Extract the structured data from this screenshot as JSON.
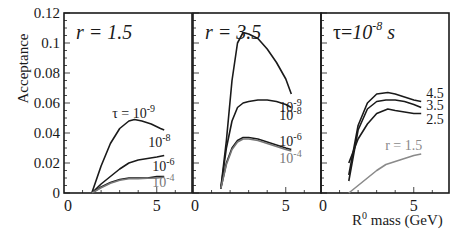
{
  "chart_data": [
    {
      "type": "line",
      "panel_title": "r = 1.5",
      "xlabel": "R0 mass (GeV)",
      "ylabel": "Acceptance",
      "xlim": [
        0,
        6.9
      ],
      "ylim": [
        0,
        0.12
      ],
      "yticks": [
        "0",
        "0.02",
        "0.04",
        "0.06",
        "0.08",
        "0.1",
        "0.12"
      ],
      "xticks": [
        "0",
        "5"
      ],
      "series": [
        {
          "name": "τ = 10^-9",
          "label": "τ = 10-9",
          "color": "#1a1a1a",
          "x": [
            1.5,
            2.0,
            2.5,
            3.0,
            3.5,
            3.8,
            4.2,
            4.7,
            5.2,
            5.4
          ],
          "y": [
            0,
            0.018,
            0.033,
            0.043,
            0.048,
            0.049,
            0.048,
            0.046,
            0.043,
            0.042
          ]
        },
        {
          "name": "τ = 10^-8",
          "label": "10-8",
          "color": "#1a1a1a",
          "x": [
            1.5,
            2.0,
            2.5,
            3.0,
            3.5,
            4.0,
            4.5,
            5.0,
            5.4
          ],
          "y": [
            0,
            0.006,
            0.011,
            0.016,
            0.02,
            0.022,
            0.023,
            0.024,
            0.025
          ]
        },
        {
          "name": "τ = 10^-6",
          "label": "10-6",
          "color": "#1a1a1a",
          "x": [
            1.5,
            2.0,
            2.5,
            3.0,
            3.5,
            4.0,
            4.5,
            5.0,
            5.4
          ],
          "y": [
            0,
            0.004,
            0.007,
            0.009,
            0.01,
            0.01,
            0.01,
            0.011,
            0.011
          ]
        },
        {
          "name": "τ = 10^-4",
          "label": "10-4",
          "color": "#777777",
          "x": [
            1.5,
            2.0,
            2.5,
            3.0,
            3.5,
            4.0,
            4.5,
            5.0,
            5.4
          ],
          "y": [
            0,
            0.0035,
            0.0065,
            0.0085,
            0.0095,
            0.0095,
            0.0098,
            0.01,
            0.0105
          ]
        }
      ]
    },
    {
      "type": "line",
      "panel_title": "r = 3.5",
      "xlim": [
        0,
        6.9
      ],
      "ylim": [
        0,
        0.12
      ],
      "xticks": [
        "0",
        "5"
      ],
      "series": [
        {
          "name": "τ = 10^-9",
          "label": "10-9",
          "color": "#1a1a1a",
          "x": [
            1.5,
            1.8,
            2.1,
            2.4,
            2.7,
            3.0,
            3.5,
            4.0,
            4.5,
            5.0,
            5.3
          ],
          "y": [
            0.003,
            0.035,
            0.075,
            0.1,
            0.107,
            0.106,
            0.103,
            0.096,
            0.087,
            0.076,
            0.066
          ]
        },
        {
          "name": "τ = 10^-8",
          "label": "10-8",
          "color": "#1a1a1a",
          "x": [
            1.5,
            1.8,
            2.1,
            2.4,
            2.7,
            3.0,
            3.5,
            4.0,
            4.5,
            5.0,
            5.3
          ],
          "y": [
            0.003,
            0.03,
            0.048,
            0.057,
            0.06,
            0.061,
            0.062,
            0.062,
            0.061,
            0.059,
            0.057
          ]
        },
        {
          "name": "τ = 10^-6",
          "label": "10-6",
          "color": "#1a1a1a",
          "x": [
            1.5,
            1.8,
            2.1,
            2.4,
            2.7,
            3.0,
            3.5,
            4.0,
            4.5,
            5.0,
            5.3
          ],
          "y": [
            0.003,
            0.02,
            0.03,
            0.035,
            0.037,
            0.037,
            0.036,
            0.034,
            0.032,
            0.03,
            0.029
          ]
        },
        {
          "name": "τ = 10^-4",
          "label": "10-4",
          "color": "#777777",
          "x": [
            1.5,
            1.8,
            2.1,
            2.4,
            2.7,
            3.0,
            3.5,
            4.0,
            4.5,
            5.0,
            5.3
          ],
          "y": [
            0.003,
            0.019,
            0.029,
            0.034,
            0.036,
            0.036,
            0.035,
            0.033,
            0.031,
            0.029,
            0.028
          ]
        }
      ]
    },
    {
      "type": "line",
      "panel_title": "τ=10^-8 s",
      "xlim": [
        0,
        6.9
      ],
      "ylim": [
        0,
        0.12
      ],
      "xticks": [
        "0",
        "5"
      ],
      "series": [
        {
          "name": "r = 4.5",
          "label": "4.5",
          "color": "#1a1a1a",
          "x": [
            1.5,
            2.0,
            2.5,
            3.0,
            3.6,
            4.0,
            4.5,
            5.0,
            5.4
          ],
          "y": [
            0.012,
            0.045,
            0.06,
            0.066,
            0.067,
            0.066,
            0.064,
            0.062,
            0.061
          ]
        },
        {
          "name": "r = 3.5",
          "label": "3.5",
          "color": "#1a1a1a",
          "x": [
            1.5,
            2.0,
            2.5,
            3.0,
            3.5,
            4.0,
            4.5,
            5.0,
            5.4
          ],
          "y": [
            0.008,
            0.042,
            0.056,
            0.061,
            0.062,
            0.062,
            0.061,
            0.059,
            0.057
          ]
        },
        {
          "name": "r = 2.5",
          "label": "2.5",
          "color": "#1a1a1a",
          "x": [
            1.5,
            2.0,
            2.5,
            3.0,
            3.6,
            4.0,
            4.5,
            5.0,
            5.4
          ],
          "y": [
            0.02,
            0.036,
            0.046,
            0.053,
            0.056,
            0.055,
            0.054,
            0.053,
            0.053
          ]
        },
        {
          "name": "r = 1.5",
          "label": "r = 1.5",
          "color": "#8a8a8a",
          "x": [
            1.5,
            2.0,
            2.5,
            3.0,
            3.5,
            4.0,
            4.5,
            5.0,
            5.4
          ],
          "y": [
            0,
            0.005,
            0.01,
            0.015,
            0.019,
            0.021,
            0.023,
            0.025,
            0.026
          ]
        }
      ]
    }
  ],
  "labels": {
    "ylabel": "Acceptance",
    "xlabel_main": "R",
    "xlabel_sup": "0",
    "xlabel_rest": " mass (GeV)"
  }
}
